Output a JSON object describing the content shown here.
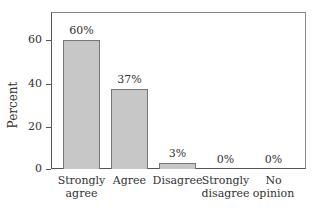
{
  "chart_data": {
    "type": "bar",
    "title": "",
    "xlabel": "",
    "ylabel": "Percent",
    "ylim": [
      0,
      73
    ],
    "yticks": [
      0,
      20,
      40,
      60
    ],
    "grid": false,
    "legend": null,
    "categories": [
      "Strongly agree",
      "Agree",
      "Disagree",
      "Strongly disagree",
      "No opinion"
    ],
    "category_lines": [
      [
        "Strongly",
        "agree"
      ],
      [
        "Agree",
        ""
      ],
      [
        "Disagree",
        ""
      ],
      [
        "Strongly",
        "disagree"
      ],
      [
        "No",
        "opinion"
      ]
    ],
    "values": [
      60,
      37,
      3,
      0,
      0
    ],
    "data_labels": [
      "60%",
      "37%",
      "3%",
      "0%",
      "0%"
    ],
    "colors": {
      "bar_fill": "#c7c7c7",
      "bar_edge": "#777777"
    }
  }
}
